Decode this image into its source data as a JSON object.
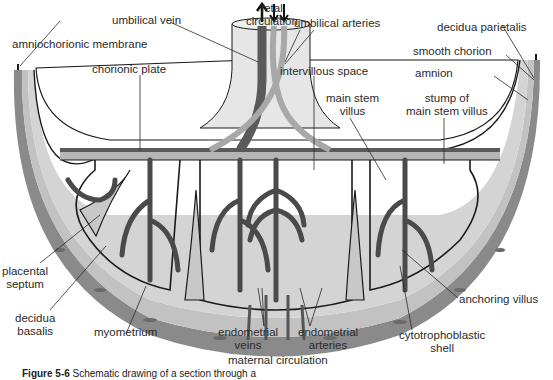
{
  "diagram": {
    "labels": {
      "fetal_circulation": [
        "fetal",
        "circulation"
      ],
      "umbilical_vein": "umbilical vein",
      "umbilical_arteries": "umbilical arteries",
      "decidua_parietalis": "decidua parietalis",
      "amniochorionic_membrane": "amniochorionic membrane",
      "smooth_chorion": "smooth chorion",
      "chorionic_plate": "chorionic plate",
      "intervillous_space": "intervillous space",
      "amnion": "amnion",
      "main_stem_villus": [
        "main stem",
        "villus"
      ],
      "stump_of_main_stem_villus": [
        "stump of",
        "main stem villus"
      ],
      "placental_septum": [
        "placental",
        "septum"
      ],
      "decidua_basalis": [
        "decidua",
        "basalis"
      ],
      "myometrium": "myometrium",
      "endometrial_veins": [
        "endometrial",
        "veins"
      ],
      "endometrial_arteries": [
        "endometrial",
        "arteries"
      ],
      "maternal_circulation": "maternal circulation",
      "anchoring_villus": "anchoring villus",
      "cytotrophoblastic_shell": [
        "cytotrophoblastic",
        "shell"
      ]
    },
    "caption": {
      "figure": "Figure 5-6",
      "text": "Schematic drawing of a section through a"
    },
    "colors": {
      "myometrium": "#8a8a8a",
      "decidua": "#c4c4c4",
      "intervillous": "#d6d6d6",
      "vessel_dark": "#5a5a5a",
      "vessel_light": "#a8a8a8",
      "outline": "#1a1a1a",
      "amniotic_cavity": "#ffffff"
    }
  }
}
